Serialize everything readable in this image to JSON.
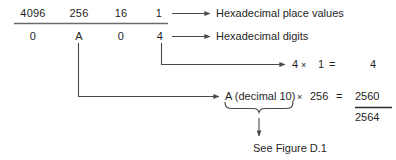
{
  "figure": {
    "place_values": {
      "label": "Hexadecimal place values",
      "values": [
        "4096",
        "256",
        "16",
        "1"
      ]
    },
    "digits": {
      "label": "Hexadecimal digits",
      "values": [
        "0",
        "A",
        "0",
        "4"
      ]
    },
    "terms": [
      {
        "digit": "4",
        "times_sign": "×",
        "place": "1",
        "equals": "=",
        "product": "4"
      },
      {
        "digit": "A (decimal 10)",
        "times_sign": "×",
        "place": "256",
        "equals": "=",
        "product": "2560"
      }
    ],
    "total": "2564",
    "note": "See Figure D.1",
    "colors": {
      "ink": "#1f1f1f",
      "rule": "#4a4a4a",
      "background": "#ffffff"
    }
  }
}
